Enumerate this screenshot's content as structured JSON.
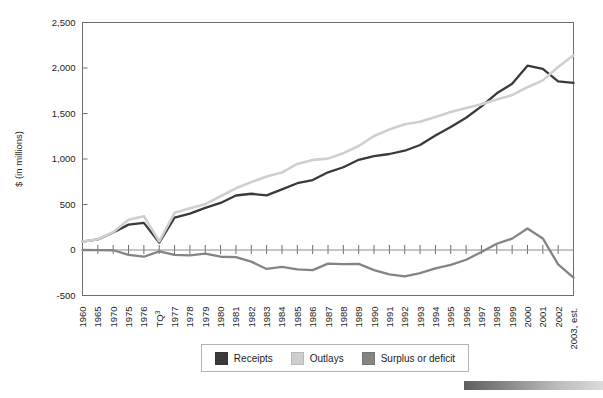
{
  "chart_data": {
    "type": "line",
    "title": "",
    "subtitle": "",
    "xlabel": "",
    "ylabel": "$ (in millions)",
    "ylim": [
      -500,
      2500
    ],
    "yticks": [
      -500,
      0,
      500,
      1000,
      1500,
      2000,
      2500
    ],
    "ytick_labels": [
      "-500",
      "0",
      "500",
      "1,000",
      "1,500",
      "2,000",
      "2,500"
    ],
    "grid": false,
    "legend_position": "bottom",
    "categories": [
      "1960",
      "1965",
      "1970",
      "1975",
      "1976",
      "TQ",
      "1977",
      "1978",
      "1979",
      "1980",
      "1981",
      "1982",
      "1983",
      "1984",
      "1985",
      "1986",
      "1987",
      "1988",
      "1989",
      "1990",
      "1991",
      "1992",
      "1993",
      "1994",
      "1995",
      "1996",
      "1997",
      "1998",
      "1999",
      "2000",
      "2001",
      "2002",
      "2003, est."
    ],
    "category_superscripts": {
      "TQ": "3"
    },
    "series": [
      {
        "name": "Receipts",
        "color": "#3a3a3a",
        "values": [
          92,
          117,
          193,
          279,
          298,
          81,
          356,
          399,
          463,
          517,
          599,
          618,
          601,
          666,
          734,
          769,
          854,
          909,
          991,
          1032,
          1055,
          1091,
          1154,
          1259,
          1352,
          1453,
          1579,
          1722,
          1827,
          2025,
          1991,
          1853,
          1836
        ]
      },
      {
        "name": "Outlays",
        "color": "#cfcfcf",
        "values": [
          92,
          118,
          196,
          332,
          372,
          96,
          409,
          459,
          504,
          591,
          678,
          746,
          808,
          852,
          946,
          990,
          1004,
          1064,
          1143,
          1253,
          1324,
          1382,
          1409,
          1462,
          1516,
          1561,
          1601,
          1653,
          1702,
          1789,
          1864,
          2011,
          2140
        ]
      },
      {
        "name": "Surplus or deficit",
        "color": "#848484",
        "values": [
          0,
          -1,
          -3,
          -53,
          -74,
          -15,
          -53,
          -59,
          -41,
          -74,
          -79,
          -128,
          -208,
          -185,
          -212,
          -221,
          -150,
          -155,
          -152,
          -221,
          -269,
          -290,
          -255,
          -203,
          -164,
          -107,
          -22,
          69,
          125,
          236,
          127,
          -158,
          -304
        ]
      }
    ]
  },
  "axis": {
    "y_axis_label": "$ (in millions)"
  },
  "legend": {
    "items": [
      {
        "label": "Receipts",
        "color": "#3a3a3a"
      },
      {
        "label": "Outlays",
        "color": "#cfcfcf"
      },
      {
        "label": "Surplus or deficit",
        "color": "#848484"
      }
    ]
  }
}
